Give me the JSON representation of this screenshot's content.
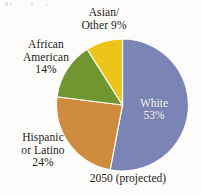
{
  "figure": {
    "caption": "2050 (projected)",
    "background_color": "#fdfcfa"
  },
  "labels": {
    "asian_other": "Asian/\nOther 9%",
    "african_american": "African\nAmerican\n14%",
    "hispanic_latino": "Hispanic\nor Latino\n24%",
    "white_inside": "White\n53%"
  },
  "chart_data": {
    "type": "pie",
    "title": "",
    "subtitle": "",
    "annotations": [
      "2050 (projected)"
    ],
    "legend_position": "callout-labels",
    "grid": false,
    "start_angle_deg": 0,
    "direction": "clockwise",
    "total": 100,
    "units": "percent",
    "categories": [
      "White",
      "Hispanic or Latino",
      "African American",
      "Asian/Other"
    ],
    "values": [
      53,
      24,
      14,
      9
    ],
    "colors": [
      "#7b85b5",
      "#d08c3e",
      "#6f9631",
      "#edc419"
    ],
    "slices": [
      {
        "name": "White",
        "value": 53,
        "label": "White 53%",
        "color": "#7b85b5",
        "label_inside": true
      },
      {
        "name": "Hispanic or Latino",
        "value": 24,
        "label": "Hispanic or Latino 24%",
        "color": "#d08c3e",
        "label_inside": false
      },
      {
        "name": "African American",
        "value": 14,
        "label": "African American 14%",
        "color": "#6f9631",
        "label_inside": false
      },
      {
        "name": "Asian/Other",
        "value": 9,
        "label": "Asian/Other 9%",
        "color": "#edc419",
        "label_inside": false
      }
    ]
  }
}
